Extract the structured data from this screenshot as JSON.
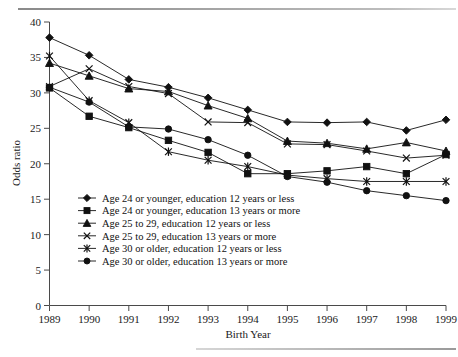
{
  "chart_data": {
    "type": "line",
    "title": "",
    "xlabel": "Birth Year",
    "ylabel": "Odds ratio",
    "categories": [
      1989,
      1990,
      1991,
      1992,
      1993,
      1994,
      1995,
      1996,
      1997,
      1998,
      1999
    ],
    "x": [
      1989,
      1990,
      1991,
      1992,
      1993,
      1994,
      1995,
      1996,
      1997,
      1998,
      1999
    ],
    "xlim": [
      1989,
      1999
    ],
    "ylim": [
      0,
      40
    ],
    "yticks": [
      0,
      5,
      10,
      15,
      20,
      25,
      30,
      35,
      40
    ],
    "xticks": [
      1989,
      1990,
      1991,
      1992,
      1993,
      1994,
      1995,
      1996,
      1997,
      1998,
      1999
    ],
    "grid": false,
    "legend_position": "inside-lower-left",
    "series": [
      {
        "name": "Age 24 or younger, education 12 years or less",
        "marker": "diamond",
        "values": [
          37.8,
          35.3,
          31.9,
          30.8,
          29.3,
          27.6,
          25.9,
          25.8,
          25.9,
          24.7,
          26.2
        ]
      },
      {
        "name": "Age 24 or younger, education 13 years or more",
        "marker": "square",
        "values": [
          30.7,
          26.7,
          25.1,
          23.3,
          21.6,
          18.6,
          18.6,
          19.0,
          19.6,
          18.6,
          21.3
        ]
      },
      {
        "name": "Age 25 to 29, education 12 years or less",
        "marker": "triangle",
        "values": [
          34.2,
          32.4,
          30.6,
          30.2,
          28.2,
          26.4,
          23.2,
          22.9,
          22.1,
          23.0,
          21.8
        ]
      },
      {
        "name": "Age 25 to 29, education 13 years or more",
        "marker": "x",
        "values": [
          30.9,
          33.4,
          30.9,
          29.9,
          25.9,
          25.8,
          22.8,
          22.7,
          21.8,
          20.8,
          21.2
        ]
      },
      {
        "name": "Age 30 or older, education 12 years or less",
        "marker": "x-star",
        "values": [
          35.2,
          28.9,
          25.8,
          21.7,
          20.5,
          19.6,
          18.4,
          17.9,
          17.5,
          17.5,
          17.5
        ]
      },
      {
        "name": "Age 30 or older, education 13 years or more",
        "marker": "circle",
        "values": [
          30.8,
          28.7,
          25.2,
          24.9,
          23.4,
          21.2,
          18.2,
          17.4,
          16.2,
          15.5,
          14.8
        ]
      }
    ]
  },
  "legend": {
    "entries": [
      {
        "label": "Age 24 or younger, education 12 years or less",
        "marker": "diamond"
      },
      {
        "label": "Age 24 or younger, education 13 years or more",
        "marker": "square"
      },
      {
        "label": "Age 25 to 29, education 12 years or less",
        "marker": "triangle"
      },
      {
        "label": "Age 25 to 29, education 13 years or more",
        "marker": "x"
      },
      {
        "label": "Age 30 or older, education 12 years or less",
        "marker": "x-star"
      },
      {
        "label": "Age 30 or older, education 13 years or more",
        "marker": "circle"
      }
    ]
  },
  "colors": {
    "ink": "#111111",
    "axis": "#4a4a4a",
    "background": "#ffffff"
  }
}
